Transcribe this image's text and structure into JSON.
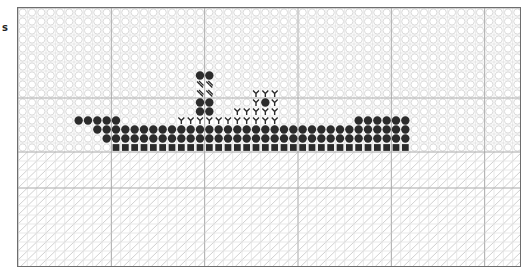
{
  "page": {
    "side_label": "s"
  },
  "chart": {
    "columns": 54,
    "rows": 29,
    "major_grid_every": 10,
    "colors": {
      "frame": "#6e6e6e",
      "grid_minor": "#d2d2d2",
      "grid_major": "#a8a8a8",
      "background_symbol": "#d6d6d6",
      "dark_symbol": "#2b2b2b",
      "water_line": "#c4c4c4"
    },
    "legend_symbols": {
      "sky": "open-circle",
      "water": "diagonal-slash",
      "hull": "filled-circle",
      "keel": "filled-square",
      "deck": "y-symbol",
      "funnel_band": "double-dash",
      "porthole": "filled-circle"
    },
    "water_start_row": 16,
    "stitches": [
      {
        "symbol": "filled-circle",
        "row": 7,
        "cols": [
          19,
          20
        ]
      },
      {
        "symbol": "double-dash",
        "row": 8,
        "cols": [
          19,
          20
        ]
      },
      {
        "symbol": "double-dash",
        "row": 9,
        "cols": [
          19,
          20
        ]
      },
      {
        "symbol": "filled-circle",
        "row": 10,
        "cols": [
          19,
          20
        ]
      },
      {
        "symbol": "filled-circle",
        "row": 11,
        "cols": [
          19,
          20
        ]
      },
      {
        "symbol": "y-symbol",
        "row": 9,
        "cols": [
          25,
          26,
          27
        ]
      },
      {
        "symbol": "y-symbol",
        "row": 10,
        "cols": [
          25,
          27
        ]
      },
      {
        "symbol": "filled-circle",
        "row": 10,
        "cols": [
          26
        ]
      },
      {
        "symbol": "y-symbol",
        "row": 11,
        "cols": [
          23,
          24,
          25,
          26,
          27
        ]
      },
      {
        "symbol": "y-symbol",
        "row": 12,
        "cols": [
          17,
          18,
          19,
          20,
          21,
          22,
          23,
          24,
          25,
          26,
          27
        ]
      },
      {
        "symbol": "filled-circle",
        "row": 12,
        "cols": [
          6,
          7,
          8,
          9,
          10,
          36,
          37,
          38,
          39,
          40,
          41
        ]
      },
      {
        "symbol": "filled-circle",
        "row": 13,
        "range": [
          8,
          41
        ]
      },
      {
        "symbol": "filled-circle",
        "row": 14,
        "range": [
          9,
          41
        ]
      },
      {
        "symbol": "filled-square",
        "row": 15,
        "range": [
          10,
          41
        ]
      }
    ]
  }
}
